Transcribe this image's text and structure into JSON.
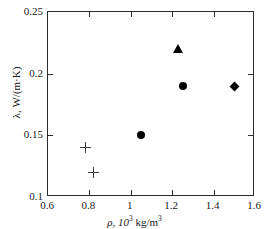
{
  "chart_data": {
    "type": "scatter",
    "title": "",
    "xlabel": "ρ, 10³ kg/m³",
    "ylabel": "λ, W/(m·K)",
    "xlim": [
      0.6,
      1.6
    ],
    "ylim": [
      0.1,
      0.25
    ],
    "xticks": [
      0.6,
      0.8,
      1.0,
      1.2,
      1.4,
      1.6
    ],
    "xtick_labels": [
      "0.6",
      "0.8",
      "1",
      "1.2",
      "1.4",
      "1.6"
    ],
    "yticks": [
      0.1,
      0.15,
      0.2,
      0.25
    ],
    "ytick_labels": [
      "0.1",
      "0.15",
      "0.2",
      "0.25"
    ],
    "grid": false,
    "legend": false,
    "series": [
      {
        "name": "plus",
        "marker": "plus",
        "color": "#3d3d3d",
        "points": [
          {
            "x": 0.78,
            "y": 0.14
          },
          {
            "x": 0.82,
            "y": 0.12
          }
        ]
      },
      {
        "name": "circle",
        "marker": "circle",
        "color": "#000000",
        "points": [
          {
            "x": 1.05,
            "y": 0.15
          },
          {
            "x": 1.25,
            "y": 0.19
          }
        ]
      },
      {
        "name": "triangle",
        "marker": "triangle",
        "color": "#000000",
        "points": [
          {
            "x": 1.23,
            "y": 0.22
          }
        ]
      },
      {
        "name": "diamond",
        "marker": "diamond",
        "color": "#000000",
        "points": [
          {
            "x": 1.5,
            "y": 0.19
          }
        ]
      }
    ]
  },
  "axis": {
    "x_title_prefix": "ρ, 10",
    "x_title_exp1": "3",
    "x_title_mid": " kg/m",
    "x_title_exp2": "3",
    "y_title": "λ, W/(m·K)"
  }
}
